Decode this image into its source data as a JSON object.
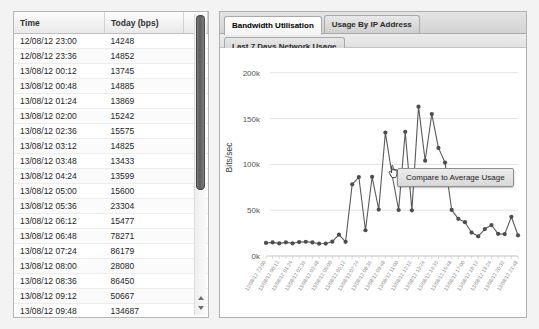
{
  "table": {
    "columns": [
      "Time",
      "Today (bps)",
      ""
    ],
    "rows": [
      {
        "time": "12/08/12 23:00",
        "value": "14248"
      },
      {
        "time": "12/08/12 23:36",
        "value": "14852"
      },
      {
        "time": "13/08/12 00:12",
        "value": "13745"
      },
      {
        "time": "13/08/12 00:48",
        "value": "14885"
      },
      {
        "time": "13/08/12 01:24",
        "value": "13869"
      },
      {
        "time": "13/08/12 02:00",
        "value": "15242"
      },
      {
        "time": "13/08/12 02:36",
        "value": "15575"
      },
      {
        "time": "13/08/12 03:12",
        "value": "14825"
      },
      {
        "time": "13/08/12 03:48",
        "value": "13433"
      },
      {
        "time": "13/08/12 04:24",
        "value": "13599"
      },
      {
        "time": "13/08/12 05:00",
        "value": "15600"
      },
      {
        "time": "13/08/12 05:36",
        "value": "23304"
      },
      {
        "time": "13/08/12 06:12",
        "value": "15477"
      },
      {
        "time": "13/08/12 06:48",
        "value": "78271"
      },
      {
        "time": "13/08/12 07:24",
        "value": "86179"
      },
      {
        "time": "13/08/12 08:00",
        "value": "28080"
      },
      {
        "time": "13/08/12 08:36",
        "value": "86450"
      },
      {
        "time": "13/08/12 09:12",
        "value": "50667"
      },
      {
        "time": "13/08/12 09:48",
        "value": "134687"
      },
      {
        "time": "13/08/12 10:24",
        "value": "88965"
      }
    ],
    "scrollbar": {
      "arrow_up": "scroll-up",
      "arrow_down": "scroll-down"
    }
  },
  "tabs": [
    {
      "label": "Bandwidth Utilisation",
      "active": true
    },
    {
      "label": "Usage By IP Address",
      "active": false
    },
    {
      "label": "Last 7 Days Network Usage",
      "active": false
    }
  ],
  "subbar": {
    "label": "Plot Yesterday"
  },
  "tooltip": {
    "label": "Compare to Average Usage",
    "cursor": "pointing-hand-cursor"
  },
  "colors": {
    "line": "#5a5a5a",
    "marker": "#4d4d4d",
    "grid": "#e2e2e2",
    "axis_text": "#555555",
    "panel_border": "#b0b0b0",
    "tab_active_bg": "#ffffff",
    "page_bg": "#f3f3f3"
  },
  "chart_data": {
    "type": "line",
    "title": "",
    "xlabel": "",
    "ylabel": "Bits/sec",
    "ylim": [
      0,
      215000
    ],
    "yticks": [
      0,
      50000,
      100000,
      150000,
      200000
    ],
    "ytick_labels": [
      "0k",
      "50k",
      "100k",
      "150k",
      "200k"
    ],
    "grid": true,
    "legend": null,
    "x": [
      "12/08/12 23:00",
      "12/08/12 23:36",
      "13/08/12 00:12",
      "13/08/12 00:48",
      "13/08/12 01:24",
      "13/08/12 02:00",
      "13/08/12 02:36",
      "13/08/12 03:12",
      "13/08/12 03:48",
      "13/08/12 04:24",
      "13/08/12 05:00",
      "13/08/12 05:36",
      "13/08/12 06:12",
      "13/08/12 06:48",
      "13/08/12 07:24",
      "13/08/12 08:00",
      "13/08/12 08:36",
      "13/08/12 09:12",
      "13/08/12 09:48",
      "13/08/12 10:24",
      "13/08/12 11:00",
      "13/08/12 11:36",
      "13/08/12 12:12",
      "13/08/12 12:48",
      "13/08/12 13:24",
      "13/08/12 14:00",
      "13/08/12 14:36",
      "13/08/12 15:12",
      "13/08/12 15:48",
      "13/08/12 16:24",
      "13/08/12 17:00",
      "13/08/12 17:36",
      "13/08/12 18:12",
      "13/08/12 18:48",
      "13/08/12 19:24",
      "13/08/12 20:00",
      "13/08/12 20:36",
      "13/08/12 21:12",
      "13/08/12 21:48"
    ],
    "xtick_labels": [
      "12/08/12 23:00",
      "13/08/12 00:12",
      "13/08/12 01:24",
      "13/08/12 02:36",
      "13/08/12 03:48",
      "13/08/12 05:00",
      "13/08/12 06:12",
      "13/08/12 07:24",
      "13/08/12 08:36",
      "13/08/12 09:48",
      "13/08/12 11:00",
      "13/08/12 12:12",
      "13/08/12 13:24",
      "13/08/12 14:36",
      "13/08/12 15:48",
      "13/08/12 17:00",
      "13/08/12 18:12",
      "13/08/12 19:24",
      "13/08/12 20:36",
      "13/08/12 21:48"
    ],
    "series": [
      {
        "name": "Today (bps)",
        "values": [
          14248,
          14852,
          13745,
          14885,
          13869,
          15242,
          15575,
          14825,
          13433,
          13599,
          15600,
          23304,
          15477,
          78271,
          86179,
          28080,
          86450,
          50667,
          134687,
          88965,
          50200,
          135500,
          49800,
          163000,
          104000,
          155000,
          118000,
          102000,
          50300,
          40600,
          36900,
          25600,
          21500,
          29400,
          33800,
          24200,
          23900,
          42800,
          22600
        ]
      }
    ]
  }
}
